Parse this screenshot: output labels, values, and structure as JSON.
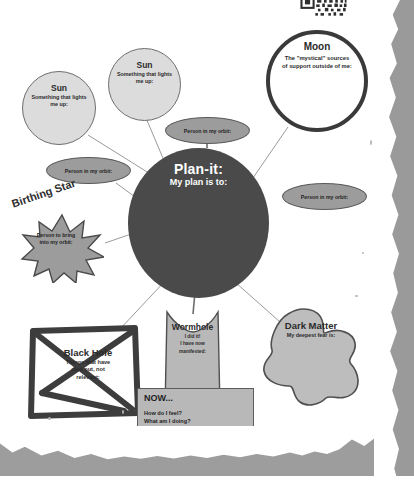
{
  "document": {
    "title": "Plan-it worksheet",
    "qr_icon": "qr-code-icon"
  },
  "center": {
    "title": "Plan-it:",
    "prompt": "My plan is to:"
  },
  "nodes": [
    {
      "id": "sun-left",
      "title": "Sun",
      "prompt_line1": "Something that lights",
      "prompt_line2": "me up:"
    },
    {
      "id": "sun-top",
      "title": "Sun",
      "prompt_line1": "Something that lights",
      "prompt_line2": "me up:"
    },
    {
      "id": "moon",
      "title": "Moon",
      "prompt_line1": "The \"mystical\" sources",
      "prompt_line2": "of support outside of me:"
    }
  ],
  "orbits": [
    {
      "id": "orbit-top",
      "label": "Person in my orbit:"
    },
    {
      "id": "orbit-left",
      "label": "Person in my orbit:"
    },
    {
      "id": "orbit-right",
      "label": "Person in my orbit:"
    }
  ],
  "birthing_star": {
    "title": "Birthing Star",
    "prompt_line1": "Person to bring",
    "prompt_line2": "into my orbit:"
  },
  "black_hole": {
    "title": "Black Hole",
    "prompt_line1": "Things that have",
    "prompt_line2": "died out, not",
    "prompt_line3": "relevant:"
  },
  "wormhole": {
    "title": "Wormhole",
    "prompt_line1": "I did it!",
    "prompt_line2": "I have now",
    "prompt_line3": "manifested:"
  },
  "dark_matter": {
    "title": "Dark Matter",
    "prompt": "My deepest fear is:"
  },
  "now_box": {
    "title": "NOW...",
    "question1": "How do I feel?",
    "question2": "What am I doing?",
    "question3": "Who or what is around me?"
  },
  "colors": {
    "center_fill": "#4a4a4a",
    "sun_fill": "#dcdcdc",
    "moon_fill": "#ffffff",
    "moon_stroke": "#3a3a3a",
    "orbit_fill": "#9c9c9c",
    "star_fill": "#9c9c9c",
    "black_hole_stroke": "#3d3d3d",
    "wormhole_fill": "#b8b8b8",
    "dark_matter_fill": "#bdbdbd",
    "now_fill": "#b8b8b8",
    "line": "#8a8a8a",
    "scan_edge": "#9a9a9a"
  }
}
